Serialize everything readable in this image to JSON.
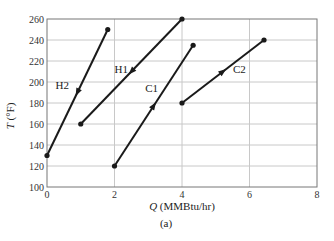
{
  "chart_data": {
    "type": "line",
    "title": "",
    "caption": "(a)",
    "xlabel": "Q (MMBtu/hr)",
    "xlabel_var": "Q",
    "xlabel_unit": " (MMBtu/hr)",
    "ylabel": "T (°F)",
    "ylabel_var": "T",
    "ylabel_unit": " (°F)",
    "xlim": [
      0,
      8
    ],
    "ylim": [
      100,
      260
    ],
    "xticks": [
      0,
      2,
      4,
      6,
      8
    ],
    "yticks": [
      100,
      120,
      140,
      160,
      180,
      200,
      220,
      240,
      260
    ],
    "grid": true,
    "legend": "none (inline labels)",
    "series": [
      {
        "name": "H2",
        "points": [
          [
            1.8,
            250
          ],
          [
            0,
            130
          ]
        ],
        "direction": "down",
        "label_pos": [
          0.45,
          197
        ]
      },
      {
        "name": "H1",
        "points": [
          [
            4,
            260
          ],
          [
            1,
            160
          ]
        ],
        "direction": "down",
        "label_pos": [
          2.2,
          212
        ]
      },
      {
        "name": "C1",
        "points": [
          [
            2,
            120
          ],
          [
            4.33,
            235
          ]
        ],
        "direction": "up",
        "label_pos": [
          3.1,
          194
        ]
      },
      {
        "name": "C2",
        "points": [
          [
            4,
            180
          ],
          [
            6.43,
            240
          ]
        ],
        "direction": "up",
        "label_pos": [
          5.7,
          212
        ]
      }
    ],
    "line_color": "#1a1a1a",
    "grid_color": "#c8c8c8"
  }
}
